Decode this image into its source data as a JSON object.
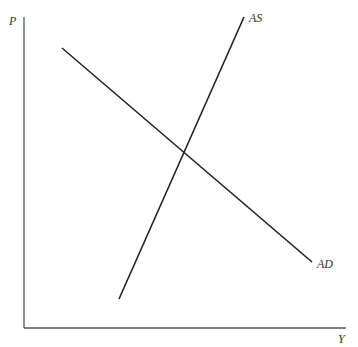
{
  "diagram": {
    "type": "AS-AD model",
    "axes": {
      "y_label": "P",
      "x_label": "Y"
    },
    "curves": [
      {
        "name": "AS",
        "label": "AS",
        "from": [
          119,
          299
        ],
        "to": [
          244,
          17
        ]
      },
      {
        "name": "AD",
        "label": "AD",
        "from": [
          62,
          48
        ],
        "to": [
          312,
          262
        ]
      }
    ],
    "colors": {
      "line": "#222222",
      "axis": "#555555",
      "label": "#333333"
    }
  }
}
